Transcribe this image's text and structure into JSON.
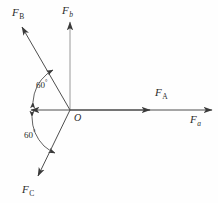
{
  "figure": {
    "background_color": "#fefefe",
    "stroke_color": "#3a3a3a",
    "text_color": "#2b2b2b"
  },
  "origin": {
    "label": "O",
    "x": 70,
    "y": 110
  },
  "axes": [
    {
      "name": "horizontal-axis",
      "label": "F",
      "subscript": "a",
      "subscript_italic": true,
      "from": [
        31,
        110
      ],
      "to": [
        212,
        110
      ],
      "arrow_start": true,
      "arrow_end": true,
      "label_x": 190,
      "label_y": 114
    },
    {
      "name": "vertical-axis",
      "label": "F",
      "subscript": "b",
      "subscript_italic": true,
      "from": [
        70,
        110
      ],
      "to": [
        70,
        22
      ],
      "arrow_start": false,
      "arrow_end": true,
      "label_x": 62,
      "label_y": 5
    }
  ],
  "vectors": [
    {
      "name": "force-a",
      "label": "F",
      "subscript": "A",
      "from": [
        70,
        110
      ],
      "to": [
        150,
        110
      ],
      "label_x": 155,
      "label_y": 87
    },
    {
      "name": "force-b",
      "label": "F",
      "subscript": "B",
      "from": [
        70,
        110
      ],
      "to": [
        22,
        27
      ],
      "label_x": 12,
      "label_y": 7
    },
    {
      "name": "force-c",
      "label": "F",
      "subscript": "C",
      "from": [
        70,
        110
      ],
      "to": [
        38,
        176
      ],
      "label_x": 22,
      "label_y": 184
    }
  ],
  "angles": [
    {
      "name": "angle-upper",
      "value": "60",
      "unit": "°",
      "label_x": 36,
      "label_y": 79,
      "between": [
        "negative-x-axis",
        "force-b"
      ]
    },
    {
      "name": "angle-lower",
      "value": "60",
      "unit": "°",
      "label_x": 24,
      "label_y": 129,
      "between": [
        "negative-x-axis",
        "force-c"
      ]
    }
  ]
}
